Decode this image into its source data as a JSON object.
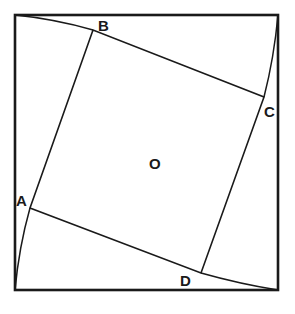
{
  "diagram": {
    "outer_square": {
      "x1": 15,
      "y1": 15,
      "x2": 278,
      "y2": 290
    },
    "inner_square_vertices": {
      "A": [
        30,
        208
      ],
      "B": [
        93,
        30
      ],
      "C": [
        264,
        97
      ],
      "D": [
        201,
        273
      ]
    },
    "labels": {
      "A": "A",
      "B": "B",
      "C": "C",
      "D": "D",
      "O": "O"
    },
    "stroke_color": "#1a1a1a",
    "background": "#ffffff"
  }
}
